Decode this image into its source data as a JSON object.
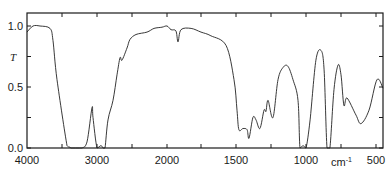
{
  "chart_data": {
    "type": "line",
    "title": "",
    "xlabel": "cm⁻¹",
    "ylabel": "T",
    "x_unit_text": "cm",
    "x_unit_sup": "-1",
    "x_axis_reversed": true,
    "x_axis_scale_note": "scale change at 2000 cm-1 (1000 cm-1 per division above 2000, 500 cm-1 per division below)",
    "xlim": [
      4000,
      450
    ],
    "ylim": [
      0.0,
      1.0
    ],
    "x_ticks": [
      4000,
      3000,
      2000,
      1500,
      1000,
      500
    ],
    "x_tick_labels": [
      "4000",
      "3000",
      "2000",
      "1500",
      "1000",
      "500"
    ],
    "y_ticks": [
      0.0,
      0.25,
      0.5,
      0.75,
      1.0
    ],
    "y_tick_labels": [
      "0.0",
      "",
      "0.5",
      "T",
      "1.0"
    ],
    "grid": false,
    "legend": null,
    "series": [
      {
        "name": "IR transmittance spectrum",
        "x": [
          4000,
          3914,
          3814,
          3671,
          3629,
          3571,
          3429,
          3400,
          3371,
          3329,
          3286,
          3214,
          3143,
          3071,
          3057,
          3000,
          2943,
          2914,
          2886,
          2843,
          2771,
          2714,
          2671,
          2643,
          2571,
          2529,
          2443,
          2286,
          2186,
          2071,
          2000,
          1964,
          1929,
          1914,
          1893,
          1821,
          1750,
          1679,
          1571,
          1514,
          1493,
          1479,
          1450,
          1421,
          1407,
          1379,
          1357,
          1329,
          1300,
          1286,
          1271,
          1236,
          1200,
          1164,
          1129,
          1093,
          1057,
          1043,
          1021,
          1000,
          971,
          929,
          893,
          871,
          850,
          829,
          800,
          771,
          750,
          729,
          707,
          643,
          607,
          550,
          493,
          450
        ],
        "y": [
          0.95,
          1.0,
          1.0,
          0.98,
          0.88,
          0.56,
          0.02,
          0.01,
          0.0,
          0.0,
          0.0,
          0.0,
          0.05,
          0.33,
          0.25,
          0.0,
          0.02,
          0.0,
          0.0,
          0.23,
          0.39,
          0.6,
          0.74,
          0.72,
          0.82,
          0.89,
          0.93,
          0.95,
          0.98,
          0.99,
          1.0,
          0.97,
          0.96,
          0.87,
          0.97,
          0.98,
          0.95,
          0.92,
          0.84,
          0.56,
          0.31,
          0.15,
          0.16,
          0.15,
          0.08,
          0.25,
          0.23,
          0.16,
          0.31,
          0.3,
          0.39,
          0.25,
          0.56,
          0.66,
          0.67,
          0.56,
          0.39,
          0.0,
          0.02,
          0.0,
          0.23,
          0.72,
          0.8,
          0.64,
          0.0,
          0.0,
          0.48,
          0.68,
          0.6,
          0.35,
          0.41,
          0.27,
          0.2,
          0.31,
          0.56,
          0.49
        ]
      }
    ]
  },
  "plot_px": {
    "left": 27,
    "right": 383,
    "top": 13,
    "bottom": 148,
    "y1_px": 26,
    "y0_px": 148
  }
}
